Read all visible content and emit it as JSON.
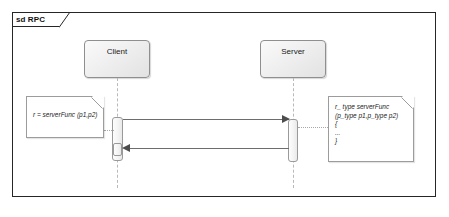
{
  "diagram": {
    "kind": "uml-sequence-diagram",
    "frame": {
      "keyword": "sd",
      "name": "RPC",
      "label": "sd RPC"
    },
    "lifelines": [
      {
        "id": "client",
        "name": "Client"
      },
      {
        "id": "server",
        "name": "Server"
      }
    ],
    "messages": [
      {
        "id": "call",
        "from": "client",
        "to": "server",
        "kind": "synchronous-call",
        "line": "solid",
        "arrowhead": "filled",
        "label": ""
      },
      {
        "id": "return",
        "from": "server",
        "to": "client",
        "kind": "reply",
        "line": "solid",
        "arrowhead": "filled",
        "label": ""
      }
    ],
    "notes": [
      {
        "id": "client-call-note",
        "attached_to": "client",
        "text": "r = serverFunc (p1,p2)"
      },
      {
        "id": "server-impl-note",
        "attached_to": "server",
        "text": "r_ type serverFunc (p_type p1,p_type p2)\n{\n...\n}"
      }
    ]
  },
  "colors": {
    "frame_border": "#262626",
    "lifeline_border": "#8f8f8f",
    "lifeline_fill": "#f1f1f1",
    "stem_dash": "#b9b9b9",
    "message_line": "#6d6d6d",
    "arrowhead": "#4d4d4d",
    "note_border": "#9c9c9c",
    "note_fill": "#ffffff",
    "text": "#1a1a1a",
    "background": "#ffffff"
  }
}
